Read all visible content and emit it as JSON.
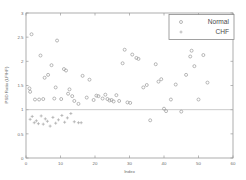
{
  "chart_data": {
    "type": "scatter",
    "title": "",
    "xlabel": "Index",
    "ylabel": "PSD Ratio (LF/HF)",
    "xlim": [
      0,
      60
    ],
    "ylim": [
      0,
      3
    ],
    "xticks": [
      0,
      10,
      20,
      30,
      40,
      50,
      60
    ],
    "xticklabels": [
      "0",
      "10",
      "20",
      "30",
      "40",
      "50",
      "60"
    ],
    "yticks": [
      0,
      0.5,
      1,
      1.5,
      2,
      2.5,
      3
    ],
    "yticklabels": [
      "0",
      "0.5",
      "1",
      "1.5",
      "2",
      "2.5",
      "3"
    ],
    "grid": false,
    "legend_position": "upper right",
    "reference_line": {
      "axis": "y",
      "value": 1
    },
    "series": [
      {
        "name": "Normal",
        "marker": "circle",
        "color": "#9a9a9a",
        "points": [
          [
            1.0,
            1.44
          ],
          [
            1.2,
            1.37
          ],
          [
            1.6,
            2.56
          ],
          [
            2.6,
            1.21
          ],
          [
            3.8,
            1.21
          ],
          [
            4.2,
            2.12
          ],
          [
            5.0,
            1.22
          ],
          [
            5.4,
            1.66
          ],
          [
            6.4,
            1.72
          ],
          [
            7.4,
            1.92
          ],
          [
            8.2,
            1.23
          ],
          [
            8.6,
            1.46
          ],
          [
            9.0,
            2.43
          ],
          [
            10.2,
            1.22
          ],
          [
            11.0,
            1.84
          ],
          [
            11.6,
            1.81
          ],
          [
            12.2,
            1.33
          ],
          [
            12.6,
            1.42
          ],
          [
            13.4,
            1.28
          ],
          [
            14.0,
            1.18
          ],
          [
            15.2,
            1.12
          ],
          [
            16.4,
            1.7
          ],
          [
            17.6,
            1.25
          ],
          [
            18.4,
            1.62
          ],
          [
            19.6,
            1.2
          ],
          [
            20.4,
            1.29
          ],
          [
            21.0,
            1.28
          ],
          [
            22.2,
            1.23
          ],
          [
            23.0,
            1.31
          ],
          [
            23.6,
            1.22
          ],
          [
            24.2,
            1.19
          ],
          [
            24.8,
            1.2
          ],
          [
            25.4,
            1.17
          ],
          [
            26.2,
            1.3
          ],
          [
            27.0,
            1.18
          ],
          [
            28.0,
            1.96
          ],
          [
            28.6,
            2.24
          ],
          [
            29.4,
            1.15
          ],
          [
            30.2,
            1.14
          ],
          [
            30.8,
            2.14
          ],
          [
            32.0,
            2.07
          ],
          [
            32.6,
            2.05
          ],
          [
            34.0,
            1.46
          ],
          [
            35.0,
            1.51
          ],
          [
            36.0,
            0.78
          ],
          [
            37.6,
            1.94
          ],
          [
            38.4,
            1.58
          ],
          [
            39.2,
            1.63
          ],
          [
            40.0,
            1.02
          ],
          [
            40.6,
            0.97
          ],
          [
            42.0,
            1.21
          ],
          [
            43.4,
            1.52
          ],
          [
            45.0,
            0.96
          ],
          [
            46.4,
            1.72
          ],
          [
            47.6,
            2.1
          ],
          [
            48.0,
            2.22
          ],
          [
            48.8,
            1.9
          ],
          [
            50.0,
            1.21
          ],
          [
            51.4,
            2.13
          ],
          [
            52.6,
            1.56
          ]
        ]
      },
      {
        "name": "CHF",
        "marker": "plus",
        "color": "#a6a6a6",
        "points": [
          [
            1.2,
            0.8
          ],
          [
            1.8,
            0.86
          ],
          [
            2.4,
            0.73
          ],
          [
            3.0,
            0.77
          ],
          [
            3.6,
            0.71
          ],
          [
            4.4,
            0.87
          ],
          [
            5.0,
            0.7
          ],
          [
            5.6,
            0.81
          ],
          [
            6.2,
            0.76
          ],
          [
            7.0,
            0.66
          ],
          [
            7.8,
            0.84
          ],
          [
            8.6,
            0.72
          ],
          [
            9.4,
            0.79
          ],
          [
            10.4,
            0.88
          ],
          [
            11.2,
            0.74
          ],
          [
            12.0,
            0.83
          ],
          [
            13.0,
            0.92
          ],
          [
            14.0,
            0.75
          ],
          [
            15.2,
            0.73
          ],
          [
            16.0,
            0.73
          ]
        ]
      }
    ]
  },
  "legend": {
    "entries": [
      {
        "label": "Normal",
        "marker": "circle"
      },
      {
        "label": "CHF",
        "marker": "plus"
      }
    ]
  }
}
